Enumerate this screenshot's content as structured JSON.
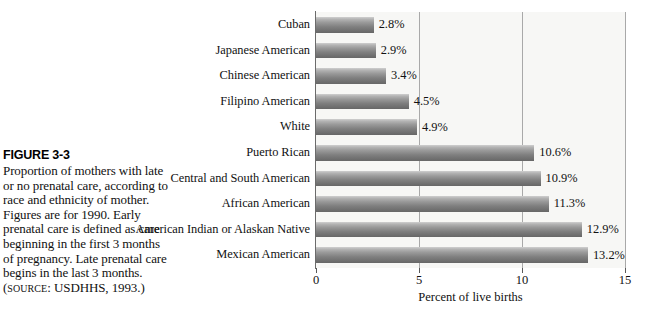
{
  "figure": {
    "number": "FIGURE 3-3",
    "caption": "Proportion of mothers with late or no prenatal care, according to race and ethnicity of mother. Figures are for 1990. Early prenatal care is defined as care beginning in the first 3 months of pregnancy. Late prenatal care begins in the last 3 months.",
    "source_prefix": "SOURCE",
    "source_text": ": USDHHS, 1993.)",
    "source_open_paren": "("
  },
  "chart_data": {
    "type": "bar",
    "orientation": "horizontal",
    "title": "",
    "xlabel": "Percent of live births",
    "ylabel": "",
    "xlim": [
      0,
      15
    ],
    "xticks": [
      0,
      5,
      10,
      15
    ],
    "xticklabels": [
      "0",
      "5",
      "10",
      "15"
    ],
    "grid": true,
    "grid_axis": "x",
    "legend": false,
    "bar_color": "#8a8a8a",
    "plot_background": "#f7f7f5",
    "categories": [
      "Cuban",
      "Japanese American",
      "Chinese American",
      "Filipino American",
      "White",
      "Puerto Rican",
      "Central and South American",
      "African American",
      "American Indian or Alaskan Native",
      "Mexican American"
    ],
    "values": [
      2.8,
      2.9,
      3.4,
      4.5,
      4.9,
      10.6,
      10.9,
      11.3,
      12.9,
      13.2
    ],
    "value_labels": [
      "2.8%",
      "2.9%",
      "3.4%",
      "4.5%",
      "4.9%",
      "10.6%",
      "10.9%",
      "11.3%",
      "12.9%",
      "13.2%"
    ]
  }
}
